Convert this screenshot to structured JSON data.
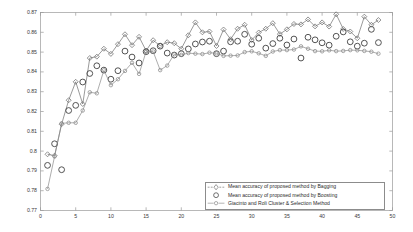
{
  "chart_data": {
    "type": "line",
    "title": "",
    "xlabel": "",
    "ylabel": "",
    "xlim": [
      0,
      50
    ],
    "ylim": [
      0.77,
      0.87
    ],
    "grid": false,
    "legend_position": "bottom-right",
    "xticks": [
      0,
      5,
      10,
      15,
      20,
      25,
      30,
      35,
      40,
      45,
      50
    ],
    "yticks": [
      "0.77",
      "0.78",
      "0.79",
      "0.8",
      "0.81",
      "0.82",
      "0.83",
      "0.84",
      "0.85",
      "0.86",
      "0.87"
    ],
    "x": [
      1,
      2,
      3,
      4,
      5,
      6,
      7,
      8,
      9,
      10,
      11,
      12,
      13,
      14,
      15,
      16,
      17,
      18,
      19,
      20,
      21,
      22,
      23,
      24,
      25,
      26,
      27,
      28,
      29,
      30,
      31,
      32,
      33,
      34,
      35,
      36,
      37,
      38,
      39,
      40,
      41,
      42,
      43,
      44,
      45,
      46,
      47,
      48
    ],
    "series": [
      {
        "name": "Mean accuracy of proposed method by Bagging",
        "marker": "diamond",
        "color": "#6e6e6e",
        "linestyle": "solid",
        "values": [
          0.7984,
          0.7977,
          0.8136,
          0.8257,
          0.835,
          0.8238,
          0.847,
          0.8477,
          0.8517,
          0.8491,
          0.854,
          0.859,
          0.8535,
          0.8577,
          0.8507,
          0.856,
          0.8532,
          0.855,
          0.8545,
          0.8517,
          0.8585,
          0.865,
          0.86,
          0.8604,
          0.8531,
          0.8614,
          0.8565,
          0.8618,
          0.8638,
          0.8561,
          0.8599,
          0.8618,
          0.8646,
          0.8591,
          0.8615,
          0.8642,
          0.864,
          0.8665,
          0.863,
          0.865,
          0.8629,
          0.8691,
          0.8617,
          0.8604,
          0.857,
          0.8679,
          0.8638,
          0.8662
        ]
      },
      {
        "name": "Mean accuracy of proposed method by Boosting",
        "marker": "circle-large",
        "color": "#4a4a4a",
        "linestyle": "none",
        "values": [
          0.7928,
          0.8037,
          0.7906,
          0.8205,
          0.8231,
          0.8349,
          0.8392,
          0.8431,
          0.8409,
          0.8363,
          0.8406,
          0.8505,
          0.8475,
          0.8445,
          0.8502,
          0.8507,
          0.853,
          0.8495,
          0.8485,
          0.8492,
          0.8516,
          0.8541,
          0.8551,
          0.8555,
          0.8492,
          0.8505,
          0.8552,
          0.8555,
          0.859,
          0.854,
          0.857,
          0.852,
          0.8543,
          0.857,
          0.8536,
          0.8566,
          0.847,
          0.8575,
          0.8562,
          0.8547,
          0.8535,
          0.858,
          0.8602,
          0.8552,
          0.853,
          0.8545,
          0.8615,
          0.8548
        ]
      },
      {
        "name": "Giacinto and Roli Cluster & Selection Method",
        "marker": "circle-small",
        "color": "#8a8a8a",
        "linestyle": "solid",
        "values": [
          0.7809,
          0.7973,
          0.814,
          0.8143,
          0.8143,
          0.8205,
          0.8297,
          0.8292,
          0.8408,
          0.8333,
          0.8363,
          0.8405,
          0.8446,
          0.839,
          0.8502,
          0.8503,
          0.8409,
          0.8432,
          0.8489,
          0.8486,
          0.8495,
          0.8492,
          0.849,
          0.8497,
          0.8494,
          0.8481,
          0.8482,
          0.8483,
          0.85,
          0.8504,
          0.8494,
          0.8481,
          0.8503,
          0.851,
          0.851,
          0.8513,
          0.8529,
          0.8517,
          0.8505,
          0.8504,
          0.8509,
          0.8505,
          0.8506,
          0.851,
          0.8509,
          0.8506,
          0.8502,
          0.8492
        ]
      }
    ]
  },
  "legend": {
    "entries": [
      {
        "label": "Mean accuracy of proposed method by Bagging"
      },
      {
        "label": "Mean accuracy of proposed method by Boosting"
      },
      {
        "label": "Giacinto and Roli Cluster & Selection Method"
      }
    ]
  }
}
